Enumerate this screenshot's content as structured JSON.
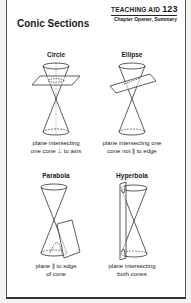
{
  "header": {
    "aid_label": "TEACHING AID",
    "aid_number": "123",
    "subtitle": "Chapter Opener, Summary"
  },
  "title": "Conic Sections",
  "sections": [
    {
      "label": "Circle",
      "caption_lines": [
        "plane intersecting",
        "one cone ⊥ to axis"
      ],
      "icon": "circle-conic-diagram-icon"
    },
    {
      "label": "Ellipse",
      "caption_lines": [
        "plane intersecting one",
        "cone not ∥ to edge"
      ],
      "icon": "ellipse-conic-diagram-icon"
    },
    {
      "label": "Parabola",
      "caption_lines": [
        "plane ∥ to edge",
        "of cone"
      ],
      "icon": "parabola-conic-diagram-icon"
    },
    {
      "label": "Hyperbola",
      "caption_lines": [
        "plane intersecting",
        "both cones"
      ],
      "icon": "hyperbola-conic-diagram-icon"
    }
  ]
}
